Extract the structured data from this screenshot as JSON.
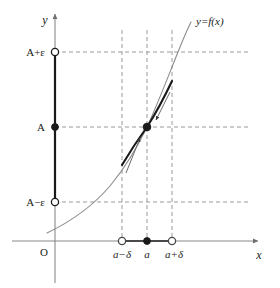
{
  "figure": {
    "kind": "epsilon-delta-limit-diagram",
    "background": "#ffffff",
    "width": 280,
    "height": 288
  },
  "axes": {
    "x_label": "x",
    "y_label": "y",
    "origin_label": "O",
    "axis_color": "#8a8a8a",
    "x_axis_y_px": 241,
    "y_axis_x_px": 55
  },
  "curve": {
    "label": "y=f(x)",
    "color": "#8c8c8c",
    "highlight_color": "#1a1a1a",
    "label_x_px": 196,
    "label_y_px": 22
  },
  "y_ticks": [
    {
      "id": "a-plus-eps",
      "label": "A+ε",
      "y_px": 52,
      "marker": "open"
    },
    {
      "id": "a",
      "label": "A",
      "y_px": 127,
      "marker": "filled"
    },
    {
      "id": "a-minus-eps",
      "label": "A−ε",
      "y_px": 202,
      "marker": "open"
    }
  ],
  "x_ticks": [
    {
      "id": "a-minus-delta",
      "label": "a−δ",
      "x_px": 122,
      "marker": "open"
    },
    {
      "id": "a",
      "label": "a",
      "x_px": 147,
      "marker": "filled"
    },
    {
      "id": "a-plus-delta",
      "label": "a+δ",
      "x_px": 172,
      "marker": "open"
    }
  ],
  "guides": {
    "color": "#9a9a9a",
    "dash": "4 3",
    "horizontal_end_x_px": 250,
    "vertical_top_y_px": 30
  },
  "segments": {
    "y_axis_epsilon_band": {
      "from_y_px": 52,
      "to_y_px": 202,
      "color": "#1a1a1a"
    },
    "x_axis_delta_band": {
      "from_x_px": 122,
      "to_x_px": 172,
      "color": "#4a4a4a"
    }
  },
  "limit_point": {
    "x_px": 147,
    "y_px": 127,
    "marker": "filled"
  },
  "arrows": [
    {
      "id": "approach-from-left",
      "label": ""
    },
    {
      "id": "approach-from-right",
      "label": ""
    }
  ]
}
